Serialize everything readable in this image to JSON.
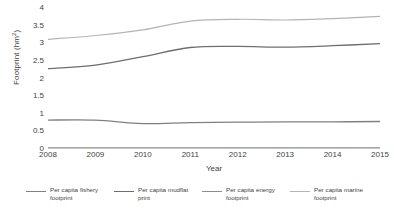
{
  "chart_data": {
    "type": "line",
    "title": "",
    "xlabel": "Year",
    "ylabel": "Footprint (hm2)",
    "ylabel_base": "Footprint (hm",
    "ylabel_sup": "2",
    "ylabel_tail": ")",
    "categories": [
      "2008",
      "2009",
      "2010",
      "2011",
      "2012",
      "2013",
      "2014",
      "2015"
    ],
    "x": [
      2008,
      2009,
      2010,
      2011,
      2012,
      2013,
      2014,
      2015
    ],
    "xlim": [
      2008,
      2015
    ],
    "ylim": [
      0,
      4
    ],
    "yticks": [
      0,
      0.5,
      1,
      1.5,
      2,
      2.5,
      3,
      3.5,
      4
    ],
    "ytick_labels": [
      "0",
      "0.5",
      "1",
      "1.5",
      "2",
      "2.5",
      "3",
      "3.5",
      "4"
    ],
    "grid": false,
    "legend_position": "bottom",
    "series": [
      {
        "name": "Per capita fishery footprint",
        "name_line1": "Per capita fishery",
        "name_line2": "footprint",
        "color": "#808080",
        "width": 1.3,
        "values": [
          0.82,
          0.82,
          0.72,
          0.75,
          0.76,
          0.77,
          0.77,
          0.78
        ]
      },
      {
        "name": "Per capita mudflat print",
        "name_line1": "Per capita mudflat",
        "name_line2": "print",
        "color": "#6e6e6e",
        "width": 1.3,
        "values": [
          2.28,
          2.38,
          2.62,
          2.88,
          2.91,
          2.89,
          2.93,
          2.99
        ]
      },
      {
        "name": "Per capita energy footprint",
        "name_line1": "Per capita energy",
        "name_line2": "footprint",
        "color": "#8c8c8c",
        "width": 1.2,
        "values": [
          0.03,
          0.03,
          0.03,
          0.03,
          0.03,
          0.03,
          0.03,
          0.03
        ]
      },
      {
        "name": "Per capita marine footprint",
        "name_line1": "Per capita marine",
        "name_line2": "footprint",
        "color": "#b4b4b4",
        "width": 1.2,
        "values": [
          3.11,
          3.22,
          3.38,
          3.63,
          3.68,
          3.66,
          3.7,
          3.76
        ]
      }
    ]
  }
}
